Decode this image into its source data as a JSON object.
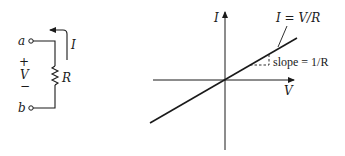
{
  "circuit": {
    "terminal_a": "a",
    "terminal_b": "b",
    "current_label": "I",
    "resistor_label": "R",
    "plus_sign": "+",
    "voltage_label": "V",
    "minus_sign": "−"
  },
  "graph": {
    "y_axis_label": "I",
    "x_axis_label": "V",
    "line_label": "I = V/R",
    "slope_label": "slope = 1/R"
  },
  "colors": {
    "ink": "#1a1a1a",
    "background": "#ffffff"
  }
}
